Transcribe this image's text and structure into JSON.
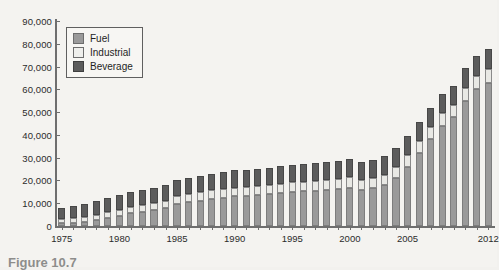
{
  "figure": {
    "caption": "Figure 10.7",
    "background_color": "#f4f3f0"
  },
  "legend": {
    "position": "top-left-inside",
    "items": [
      {
        "label": "Fuel",
        "color": "#9a9a9a",
        "swatch": "fuel-swatch"
      },
      {
        "label": "Industrial",
        "color": "#efefec",
        "swatch": "industrial-swatch"
      },
      {
        "label": "Beverage",
        "color": "#5c5c5c",
        "swatch": "beverage-swatch"
      }
    ]
  },
  "chart_data": {
    "type": "bar",
    "stacked": true,
    "title": "",
    "subtitle": "",
    "xlabel": "",
    "ylabel": "",
    "ylim": [
      0,
      90000
    ],
    "ytick_labels": [
      "0",
      "10,000",
      "20,000",
      "30,000",
      "40,000",
      "50,000",
      "60,000",
      "70,000",
      "80,000",
      "90,000"
    ],
    "ytick_values": [
      0,
      10000,
      20000,
      30000,
      40000,
      50000,
      60000,
      70000,
      80000,
      90000
    ],
    "grid": false,
    "legend_position": "upper left",
    "xtick_labels": [
      "1975",
      "1980",
      "1985",
      "1990",
      "1995",
      "2000",
      "2005",
      "2012"
    ],
    "xtick_values": [
      1975,
      1980,
      1985,
      1990,
      1995,
      2000,
      2005,
      2012
    ],
    "categories": [
      1975,
      1976,
      1977,
      1978,
      1979,
      1980,
      1981,
      1982,
      1983,
      1984,
      1985,
      1986,
      1987,
      1988,
      1989,
      1990,
      1991,
      1992,
      1993,
      1994,
      1995,
      1996,
      1997,
      1998,
      1999,
      2000,
      2001,
      2002,
      2003,
      2004,
      2005,
      2006,
      2007,
      2008,
      2009,
      2010,
      2011,
      2012
    ],
    "series": [
      {
        "name": "Fuel",
        "color": "#9a9a9a",
        "values": [
          1200,
          1500,
          1900,
          2500,
          3300,
          4200,
          5500,
          6200,
          6900,
          8000,
          9800,
          10500,
          11200,
          12000,
          12500,
          13000,
          13200,
          13600,
          14000,
          14500,
          15000,
          15200,
          15500,
          15800,
          16200,
          16800,
          15800,
          16500,
          18000,
          21000,
          26000,
          32000,
          38000,
          44000,
          48000,
          55000,
          60000,
          63000
        ]
      },
      {
        "name": "Industrial",
        "color": "#efefec",
        "values": [
          1800,
          2000,
          2200,
          2500,
          2700,
          2900,
          3000,
          2900,
          3000,
          3200,
          3400,
          3500,
          3600,
          3700,
          3800,
          3900,
          3900,
          4000,
          4000,
          4100,
          4200,
          4200,
          4300,
          4300,
          4400,
          4500,
          4400,
          4500,
          4600,
          4800,
          5000,
          5200,
          5400,
          5500,
          5200,
          5600,
          5800,
          5900
        ]
      },
      {
        "name": "Beverage",
        "color": "#5c5c5c",
        "values": [
          5000,
          5300,
          5600,
          6000,
          6300,
          6500,
          6600,
          6700,
          6800,
          6900,
          7000,
          7100,
          7200,
          7300,
          7400,
          7500,
          7500,
          7600,
          7600,
          7700,
          7800,
          7800,
          7900,
          7900,
          8000,
          8100,
          8000,
          8100,
          8200,
          8300,
          8400,
          8500,
          8600,
          8600,
          8400,
          8600,
          8700,
          8800
        ]
      }
    ],
    "totals": [
      8000,
      8800,
      9700,
      11000,
      12300,
      13600,
      15100,
      15800,
      16700,
      18100,
      20200,
      21100,
      22000,
      23000,
      23700,
      24400,
      24600,
      25200,
      25600,
      26300,
      27000,
      27200,
      27700,
      28000,
      28600,
      29400,
      28200,
      29100,
      30800,
      34100,
      39400,
      45700,
      52000,
      58100,
      61600,
      69200,
      74500,
      77700
    ]
  }
}
